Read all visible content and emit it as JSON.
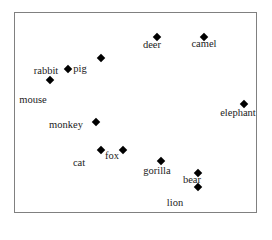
{
  "chart_data": {
    "type": "scatter",
    "title": "",
    "xlabel": "",
    "ylabel": "",
    "grid": false,
    "legend": null,
    "points": [
      {
        "x": 101,
        "y": 58,
        "label": ""
      },
      {
        "x": 68,
        "y": 69,
        "label": "pig"
      },
      {
        "x": 50,
        "y": 80,
        "label": "rabbit"
      },
      {
        "x": 157,
        "y": 37,
        "label": "deer"
      },
      {
        "x": 204,
        "y": 37,
        "label": "camel"
      },
      {
        "x": 244,
        "y": 104,
        "label": "elephant"
      },
      {
        "x": 96,
        "y": 122,
        "label": "monkey"
      },
      {
        "x": 101,
        "y": 150,
        "label": "cat"
      },
      {
        "x": 123,
        "y": 150,
        "label": "fox"
      },
      {
        "x": 161,
        "y": 161,
        "label": "gorilla"
      },
      {
        "x": 198,
        "y": 173,
        "label": "bear"
      },
      {
        "x": 198,
        "y": 187,
        "label": "lion"
      }
    ],
    "labels": [
      {
        "text": "pig",
        "x": 80,
        "y": 69
      },
      {
        "text": "rabbit",
        "x": 46,
        "y": 71
      },
      {
        "text": "mouse",
        "x": 33,
        "y": 100
      },
      {
        "text": "deer",
        "x": 152,
        "y": 45
      },
      {
        "text": "camel",
        "x": 204,
        "y": 44
      },
      {
        "text": "elephant",
        "x": 238,
        "y": 113
      },
      {
        "text": "monkey",
        "x": 66,
        "y": 125
      },
      {
        "text": "fox",
        "x": 112,
        "y": 156
      },
      {
        "text": "cat",
        "x": 79,
        "y": 163
      },
      {
        "text": "gorilla",
        "x": 157,
        "y": 171
      },
      {
        "text": "bear",
        "x": 192,
        "y": 180
      },
      {
        "text": "lion",
        "x": 175,
        "y": 203
      }
    ]
  }
}
